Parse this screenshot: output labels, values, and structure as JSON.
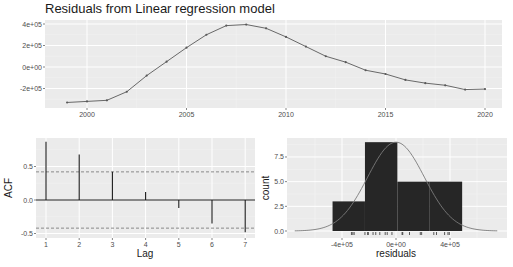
{
  "chart_data": [
    {
      "type": "line",
      "title": "Residuals from Linear regression model",
      "xlabel": "",
      "ylabel": "",
      "x": [
        1999,
        2000,
        2001,
        2002,
        2003,
        2004,
        2005,
        2006,
        2007,
        2008,
        2009,
        2010,
        2011,
        2012,
        2013,
        2014,
        2015,
        2016,
        2017,
        2018,
        2019,
        2020
      ],
      "values": [
        -330000,
        -320000,
        -310000,
        -230000,
        -80000,
        50000,
        180000,
        300000,
        385000,
        395000,
        360000,
        280000,
        190000,
        100000,
        45000,
        -30000,
        -65000,
        -120000,
        -150000,
        -170000,
        -210000,
        -205000
      ],
      "xticks": [
        "2000",
        "2005",
        "2010",
        "2015",
        "2020"
      ],
      "yticks": [
        "-2e+05",
        "0e+00",
        "2e+05",
        "4e+05"
      ],
      "ylim": [
        -350000,
        420000
      ],
      "grid": true
    },
    {
      "type": "bar",
      "title": "",
      "xlabel": "Lag",
      "ylabel": "ACF",
      "categories": [
        "1",
        "2",
        "3",
        "4",
        "5",
        "6",
        "7"
      ],
      "values": [
        0.87,
        0.68,
        0.42,
        0.12,
        -0.12,
        -0.35,
        -0.48
      ],
      "ci": [
        -0.42,
        0.42
      ],
      "yticks": [
        "-0.5",
        "0.0",
        "0.5"
      ],
      "ylim": [
        -0.55,
        0.93
      ],
      "grid": true
    },
    {
      "type": "bar",
      "title": "",
      "xlabel": "residuals",
      "ylabel": "count",
      "bins": [
        {
          "from": -470000,
          "to": -230000,
          "count": 3
        },
        {
          "from": -230000,
          "to": 10000,
          "count": 9
        },
        {
          "from": 10000,
          "to": 250000,
          "count": 5
        },
        {
          "from": 250000,
          "to": 490000,
          "count": 5
        }
      ],
      "xticks": [
        "-4e+05",
        "0e+00",
        "4e+05"
      ],
      "yticks": [
        "0.0",
        "2.5",
        "5.0",
        "7.5"
      ],
      "ylim": [
        0,
        9.4
      ],
      "overlay": "normal density curve",
      "rug": true,
      "grid": true
    }
  ],
  "colors": {
    "panel_bg": "#ebebeb",
    "grid_major": "#ffffff",
    "grid_minor": "#f5f5f5",
    "line": "#595959",
    "bar_fill": "#262626",
    "ci_line": "#7f7f7f",
    "density": "#7a7a7a",
    "text": "#4d4d4d"
  }
}
